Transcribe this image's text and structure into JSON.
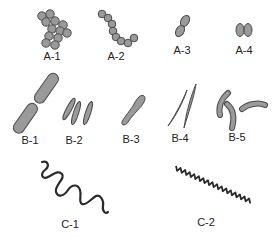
{
  "colors": {
    "fill": "#9a9a9a",
    "stroke": "#4a4a4a",
    "spiral": "#2a2a2a",
    "label": "#222222",
    "background": "#ffffff"
  },
  "diagram": {
    "groups": [
      {
        "id": "A",
        "description": "cocci (spherical)",
        "items": [
          {
            "label": "A-1",
            "shape": "staphylococci-cluster"
          },
          {
            "label": "A-2",
            "shape": "streptococci-chain"
          },
          {
            "label": "A-3",
            "shape": "diplococci-oval"
          },
          {
            "label": "A-4",
            "shape": "diplococci-kidney"
          }
        ]
      },
      {
        "id": "B",
        "description": "bacilli (rod)",
        "items": [
          {
            "label": "B-1",
            "shape": "diplobacilli-rods"
          },
          {
            "label": "B-2",
            "shape": "fusiform-rods"
          },
          {
            "label": "B-3",
            "shape": "club-shaped-rod"
          },
          {
            "label": "B-4",
            "shape": "needle-rods"
          },
          {
            "label": "B-5",
            "shape": "curved-rods-vibrio"
          }
        ]
      },
      {
        "id": "C",
        "description": "spirals",
        "items": [
          {
            "label": "C-1",
            "shape": "loose-spiral-spirillum"
          },
          {
            "label": "C-2",
            "shape": "tight-spiral-spirochete"
          }
        ]
      }
    ]
  }
}
